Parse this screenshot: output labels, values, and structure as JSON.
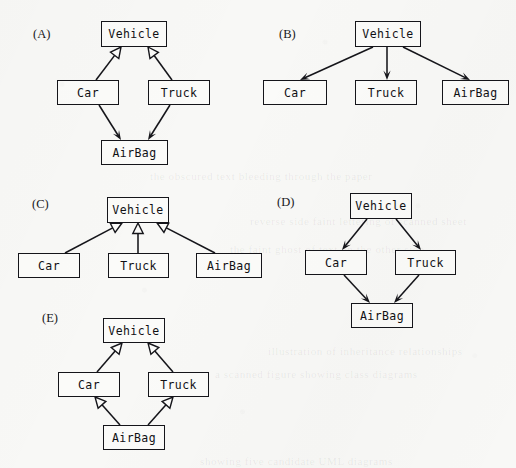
{
  "page": {
    "background_color": "#f8f8f6",
    "ink_color": "#15151a",
    "node_fill_color": "#fbfbf9",
    "width": 516,
    "height": 468
  },
  "ghost_text": [
    {
      "text": "the obscured text bleeding through the paper",
      "x": 150,
      "y": 170
    },
    {
      "text": "reverse side faint lettering of scanned sheet",
      "x": 250,
      "y": 215
    },
    {
      "text": "the faint ghost of text on the other side",
      "x": 230,
      "y": 243
    },
    {
      "text": "illustration of inheritance relationships",
      "x": 268,
      "y": 345
    },
    {
      "text": "a scanned figure showing class diagrams",
      "x": 215,
      "y": 368
    },
    {
      "text": "showing five candidate UML diagrams",
      "x": 200,
      "y": 455
    }
  ],
  "diagrams": [
    {
      "id": "A",
      "tag": "(A)",
      "tag_x": 33,
      "tag_y": 27,
      "nodes": [
        {
          "name": "vehicle",
          "label": "Vehicle",
          "x": 101,
          "y": 21,
          "w": 66,
          "h": 26
        },
        {
          "name": "car",
          "label": "Car",
          "x": 57,
          "y": 80,
          "w": 62,
          "h": 25
        },
        {
          "name": "truck",
          "label": "Truck",
          "x": 148,
          "y": 80,
          "w": 62,
          "h": 25
        },
        {
          "name": "airbag",
          "label": "AirBag",
          "x": 101,
          "y": 140,
          "w": 67,
          "h": 25
        }
      ],
      "edges": [
        {
          "name": "car-generalizes-vehicle",
          "from": "car",
          "to": "vehicle",
          "arrow": "hollow-triangle",
          "x1": 96,
          "y1": 80,
          "x2": 121,
          "y2": 47
        },
        {
          "name": "truck-generalizes-vehicle",
          "from": "truck",
          "to": "vehicle",
          "arrow": "hollow-triangle",
          "x1": 172,
          "y1": 80,
          "x2": 148,
          "y2": 47
        },
        {
          "name": "car-associates-airbag",
          "from": "car",
          "to": "airbag",
          "arrow": "solid-arrow",
          "x1": 99,
          "y1": 105,
          "x2": 121,
          "y2": 140
        },
        {
          "name": "truck-associates-airbag",
          "from": "truck",
          "to": "airbag",
          "arrow": "solid-arrow",
          "x1": 170,
          "y1": 105,
          "x2": 148,
          "y2": 140
        }
      ]
    },
    {
      "id": "B",
      "tag": "(B)",
      "tag_x": 279,
      "tag_y": 27,
      "nodes": [
        {
          "name": "vehicle",
          "label": "Vehicle",
          "x": 355,
          "y": 21,
          "w": 66,
          "h": 26
        },
        {
          "name": "car",
          "label": "Car",
          "x": 263,
          "y": 80,
          "w": 64,
          "h": 25
        },
        {
          "name": "truck",
          "label": "Truck",
          "x": 355,
          "y": 80,
          "w": 62,
          "h": 25
        },
        {
          "name": "airbag",
          "label": "AirBag",
          "x": 442,
          "y": 80,
          "w": 67,
          "h": 25
        }
      ],
      "edges": [
        {
          "name": "vehicle-points-car",
          "from": "vehicle",
          "to": "car",
          "arrow": "solid-arrow",
          "x1": 373,
          "y1": 47,
          "x2": 300,
          "y2": 80
        },
        {
          "name": "vehicle-points-truck",
          "from": "vehicle",
          "to": "truck",
          "arrow": "solid-arrow",
          "x1": 387,
          "y1": 47,
          "x2": 387,
          "y2": 80
        },
        {
          "name": "vehicle-points-airbag",
          "from": "vehicle",
          "to": "airbag",
          "arrow": "solid-arrow",
          "x1": 403,
          "y1": 47,
          "x2": 470,
          "y2": 80
        }
      ]
    },
    {
      "id": "C",
      "tag": "(C)",
      "tag_x": 32,
      "tag_y": 197,
      "nodes": [
        {
          "name": "vehicle",
          "label": "Vehicle",
          "x": 107,
          "y": 197,
          "w": 62,
          "h": 26
        },
        {
          "name": "car",
          "label": "Car",
          "x": 18,
          "y": 253,
          "w": 62,
          "h": 25
        },
        {
          "name": "truck",
          "label": "Truck",
          "x": 108,
          "y": 253,
          "w": 61,
          "h": 25
        },
        {
          "name": "airbag",
          "label": "AirBag",
          "x": 196,
          "y": 253,
          "w": 66,
          "h": 25
        }
      ],
      "edges": [
        {
          "name": "car-generalizes-vehicle",
          "from": "car",
          "to": "vehicle",
          "arrow": "hollow-triangle",
          "x1": 65,
          "y1": 253,
          "x2": 122,
          "y2": 223
        },
        {
          "name": "truck-generalizes-vehicle",
          "from": "truck",
          "to": "vehicle",
          "arrow": "hollow-triangle",
          "x1": 138,
          "y1": 253,
          "x2": 138,
          "y2": 223
        },
        {
          "name": "airbag-generalizes-vehicle",
          "from": "airbag",
          "to": "vehicle",
          "arrow": "hollow-triangle",
          "x1": 215,
          "y1": 253,
          "x2": 157,
          "y2": 223
        }
      ]
    },
    {
      "id": "D",
      "tag": "(D)",
      "tag_x": 277,
      "tag_y": 195,
      "nodes": [
        {
          "name": "vehicle",
          "label": "Vehicle",
          "x": 350,
          "y": 193,
          "w": 62,
          "h": 26
        },
        {
          "name": "car",
          "label": "Car",
          "x": 305,
          "y": 250,
          "w": 62,
          "h": 25
        },
        {
          "name": "truck",
          "label": "Truck",
          "x": 395,
          "y": 250,
          "w": 61,
          "h": 25
        },
        {
          "name": "airbag",
          "label": "AirBag",
          "x": 351,
          "y": 303,
          "w": 62,
          "h": 25
        }
      ],
      "edges": [
        {
          "name": "vehicle-points-car",
          "from": "vehicle",
          "to": "car",
          "arrow": "solid-arrow",
          "x1": 367,
          "y1": 219,
          "x2": 342,
          "y2": 250
        },
        {
          "name": "vehicle-points-truck",
          "from": "vehicle",
          "to": "truck",
          "arrow": "solid-arrow",
          "x1": 396,
          "y1": 219,
          "x2": 421,
          "y2": 250
        },
        {
          "name": "car-points-airbag",
          "from": "car",
          "to": "airbag",
          "arrow": "solid-arrow",
          "x1": 344,
          "y1": 275,
          "x2": 370,
          "y2": 303
        },
        {
          "name": "truck-points-airbag",
          "from": "truck",
          "to": "airbag",
          "arrow": "solid-arrow",
          "x1": 419,
          "y1": 275,
          "x2": 394,
          "y2": 303
        }
      ]
    },
    {
      "id": "E",
      "tag": "(E)",
      "tag_x": 42,
      "tag_y": 311,
      "nodes": [
        {
          "name": "vehicle",
          "label": "Vehicle",
          "x": 103,
          "y": 318,
          "w": 62,
          "h": 25
        },
        {
          "name": "car",
          "label": "Car",
          "x": 58,
          "y": 372,
          "w": 62,
          "h": 25
        },
        {
          "name": "truck",
          "label": "Truck",
          "x": 148,
          "y": 372,
          "w": 61,
          "h": 25
        },
        {
          "name": "airbag",
          "label": "AirBag",
          "x": 103,
          "y": 425,
          "w": 62,
          "h": 25
        }
      ],
      "edges": [
        {
          "name": "car-generalizes-vehicle",
          "from": "car",
          "to": "vehicle",
          "arrow": "hollow-triangle",
          "x1": 97,
          "y1": 372,
          "x2": 122,
          "y2": 343
        },
        {
          "name": "truck-generalizes-vehicle",
          "from": "truck",
          "to": "vehicle",
          "arrow": "hollow-triangle",
          "x1": 173,
          "y1": 372,
          "x2": 148,
          "y2": 343
        },
        {
          "name": "airbag-generalizes-car",
          "from": "airbag",
          "to": "car",
          "arrow": "hollow-triangle",
          "x1": 120,
          "y1": 425,
          "x2": 95,
          "y2": 397
        },
        {
          "name": "airbag-generalizes-truck",
          "from": "airbag",
          "to": "truck",
          "arrow": "hollow-triangle",
          "x1": 148,
          "y1": 425,
          "x2": 173,
          "y2": 397
        }
      ]
    }
  ]
}
